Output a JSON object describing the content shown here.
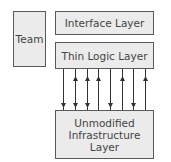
{
  "diagram": {
    "team": "Team",
    "interface_layer": "Interface Layer",
    "thin_logic_layer": "Thin Logic Layer",
    "infrastructure_layer": "Unmodified Infrastructure Layer",
    "infrastructure_lines": [
      "Unmodified",
      "Infrastructure",
      "Layer"
    ],
    "arrows": [
      {
        "x": 63,
        "direction": "down"
      },
      {
        "x": 75,
        "direction": "both"
      },
      {
        "x": 87,
        "direction": "both"
      },
      {
        "x": 98,
        "direction": "up"
      },
      {
        "x": 110,
        "direction": "down"
      },
      {
        "x": 122,
        "direction": "up"
      },
      {
        "x": 133,
        "direction": "down"
      },
      {
        "x": 145,
        "direction": "up"
      }
    ],
    "colors": {
      "box_fill": "#ebebeb",
      "border": "#5a5a5a",
      "text": "#444444",
      "arrow": "#333333"
    }
  }
}
